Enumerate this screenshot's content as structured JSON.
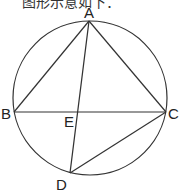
{
  "caption": "图形示意如下：",
  "diagram": {
    "type": "circle-inscribed-quadrilateral",
    "circle": {
      "cx": 90,
      "cy": 98,
      "r": 78
    },
    "points": {
      "A": {
        "label": "A",
        "x": 89,
        "y": 21
      },
      "B": {
        "label": "B",
        "x": 14,
        "y": 112
      },
      "C": {
        "label": "C",
        "x": 166,
        "y": 112
      },
      "D": {
        "label": "D",
        "x": 70,
        "y": 173
      },
      "E": {
        "label": "E",
        "x": 79,
        "y": 112
      }
    },
    "segments": [
      "AB",
      "AC",
      "BC",
      "AD",
      "CD"
    ],
    "stroke_color": "#333333"
  }
}
